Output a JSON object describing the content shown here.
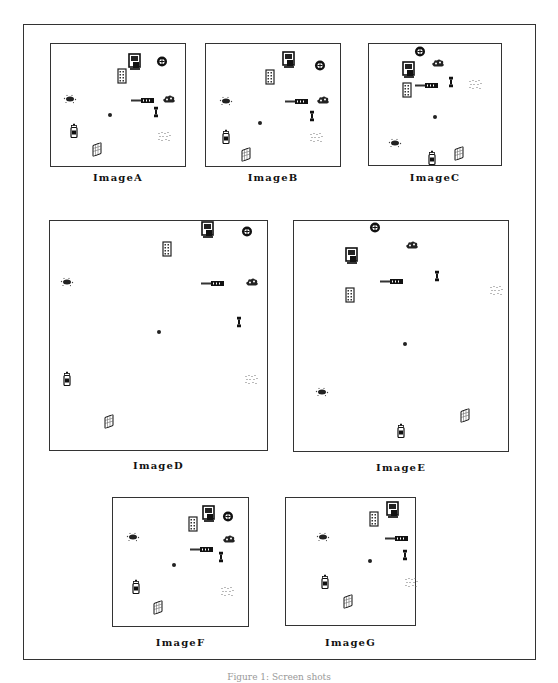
{
  "figure": {
    "caption": "Figure 1: Screen shots"
  },
  "panels": [
    {
      "id": "A",
      "label": "ImageA",
      "box": [
        50,
        43,
        136,
        124
      ],
      "label_y": 172,
      "objects": [
        {
          "type": "monitor",
          "x": 0.63,
          "y": 0.16
        },
        {
          "type": "wheel",
          "x": 0.83,
          "y": 0.15
        },
        {
          "type": "building",
          "x": 0.53,
          "y": 0.28
        },
        {
          "type": "pipe",
          "x": 0.69,
          "y": 0.44
        },
        {
          "type": "cloud",
          "x": 0.88,
          "y": 0.44
        },
        {
          "type": "splat",
          "x": 0.14,
          "y": 0.44
        },
        {
          "type": "dot",
          "x": 0.44,
          "y": 0.56
        },
        {
          "type": "key",
          "x": 0.78,
          "y": 0.56
        },
        {
          "type": "bottle",
          "x": 0.17,
          "y": 0.73
        },
        {
          "type": "dots",
          "x": 0.85,
          "y": 0.75
        },
        {
          "type": "panel",
          "x": 0.34,
          "y": 0.88
        }
      ]
    },
    {
      "id": "B",
      "label": "ImageB",
      "box": [
        205,
        43,
        136,
        124
      ],
      "label_y": 172,
      "objects": [
        {
          "type": "monitor",
          "x": 0.62,
          "y": 0.15
        },
        {
          "type": "wheel",
          "x": 0.85,
          "y": 0.18
        },
        {
          "type": "building",
          "x": 0.48,
          "y": 0.29
        },
        {
          "type": "pipe",
          "x": 0.68,
          "y": 0.45
        },
        {
          "type": "cloud",
          "x": 0.87,
          "y": 0.45
        },
        {
          "type": "splat",
          "x": 0.15,
          "y": 0.46
        },
        {
          "type": "key",
          "x": 0.79,
          "y": 0.59
        },
        {
          "type": "dot",
          "x": 0.4,
          "y": 0.62
        },
        {
          "type": "bottle",
          "x": 0.15,
          "y": 0.78
        },
        {
          "type": "dots",
          "x": 0.83,
          "y": 0.76
        },
        {
          "type": "panel",
          "x": 0.3,
          "y": 0.92
        }
      ]
    },
    {
      "id": "C",
      "label": "ImageC",
      "box": [
        368,
        43,
        134,
        123
      ],
      "label_y": 172,
      "objects": [
        {
          "type": "wheel",
          "x": 0.39,
          "y": 0.07
        },
        {
          "type": "cloud",
          "x": 0.52,
          "y": 0.15
        },
        {
          "type": "monitor",
          "x": 0.3,
          "y": 0.23
        },
        {
          "type": "pipe",
          "x": 0.44,
          "y": 0.32
        },
        {
          "type": "key",
          "x": 0.62,
          "y": 0.31
        },
        {
          "type": "dots",
          "x": 0.81,
          "y": 0.33
        },
        {
          "type": "building",
          "x": 0.29,
          "y": 0.4
        },
        {
          "type": "dot",
          "x": 0.5,
          "y": 0.58
        },
        {
          "type": "splat",
          "x": 0.2,
          "y": 0.81
        },
        {
          "type": "bottle",
          "x": 0.48,
          "y": 0.96
        },
        {
          "type": "panel",
          "x": 0.68,
          "y": 0.92
        }
      ]
    },
    {
      "id": "D",
      "label": "ImageD",
      "box": [
        49,
        220,
        219,
        231
      ],
      "label_y": 460,
      "objects": [
        {
          "type": "monitor",
          "x": 0.73,
          "y": 0.05
        },
        {
          "type": "wheel",
          "x": 0.91,
          "y": 0.05
        },
        {
          "type": "building",
          "x": 0.54,
          "y": 0.13
        },
        {
          "type": "splat",
          "x": 0.08,
          "y": 0.26
        },
        {
          "type": "pipe",
          "x": 0.75,
          "y": 0.26
        },
        {
          "type": "cloud",
          "x": 0.93,
          "y": 0.26
        },
        {
          "type": "key",
          "x": 0.87,
          "y": 0.44
        },
        {
          "type": "dot",
          "x": 0.5,
          "y": 0.47
        },
        {
          "type": "bottle",
          "x": 0.08,
          "y": 0.7
        },
        {
          "type": "dots",
          "x": 0.93,
          "y": 0.69
        },
        {
          "type": "panel",
          "x": 0.27,
          "y": 0.88
        }
      ]
    },
    {
      "id": "E",
      "label": "ImageE",
      "box": [
        293,
        220,
        216,
        232
      ],
      "label_y": 462,
      "objects": [
        {
          "type": "wheel",
          "x": 0.38,
          "y": 0.03
        },
        {
          "type": "cloud",
          "x": 0.55,
          "y": 0.1
        },
        {
          "type": "monitor",
          "x": 0.27,
          "y": 0.16
        },
        {
          "type": "pipe",
          "x": 0.46,
          "y": 0.25
        },
        {
          "type": "key",
          "x": 0.67,
          "y": 0.24
        },
        {
          "type": "dots",
          "x": 0.95,
          "y": 0.3
        },
        {
          "type": "building",
          "x": 0.26,
          "y": 0.33
        },
        {
          "type": "dot",
          "x": 0.52,
          "y": 0.52
        },
        {
          "type": "splat",
          "x": 0.13,
          "y": 0.74
        },
        {
          "type": "panel",
          "x": 0.8,
          "y": 0.85
        },
        {
          "type": "bottle",
          "x": 0.5,
          "y": 0.92
        }
      ]
    },
    {
      "id": "F",
      "label": "ImageF",
      "box": [
        112,
        497,
        137,
        130
      ],
      "label_y": 637,
      "objects": [
        {
          "type": "monitor",
          "x": 0.71,
          "y": 0.14
        },
        {
          "type": "wheel",
          "x": 0.85,
          "y": 0.15
        },
        {
          "type": "building",
          "x": 0.59,
          "y": 0.22
        },
        {
          "type": "splat",
          "x": 0.15,
          "y": 0.3
        },
        {
          "type": "cloud",
          "x": 0.86,
          "y": 0.31
        },
        {
          "type": "pipe",
          "x": 0.66,
          "y": 0.38
        },
        {
          "type": "key",
          "x": 0.8,
          "y": 0.46
        },
        {
          "type": "dot",
          "x": 0.45,
          "y": 0.5
        },
        {
          "type": "bottle",
          "x": 0.17,
          "y": 0.71
        },
        {
          "type": "dots",
          "x": 0.85,
          "y": 0.73
        },
        {
          "type": "panel",
          "x": 0.33,
          "y": 0.87
        }
      ]
    },
    {
      "id": "G",
      "label": "ImageG",
      "box": [
        285,
        497,
        131,
        129
      ],
      "label_y": 637,
      "objects": [
        {
          "type": "monitor",
          "x": 0.83,
          "y": 0.11
        },
        {
          "type": "building",
          "x": 0.68,
          "y": 0.18
        },
        {
          "type": "splat",
          "x": 0.29,
          "y": 0.3
        },
        {
          "type": "pipe",
          "x": 0.86,
          "y": 0.3
        },
        {
          "type": "key",
          "x": 0.92,
          "y": 0.45
        },
        {
          "type": "dot",
          "x": 0.65,
          "y": 0.47
        },
        {
          "type": "bottle",
          "x": 0.3,
          "y": 0.68
        },
        {
          "type": "dots",
          "x": 0.98,
          "y": 0.66
        },
        {
          "type": "panel",
          "x": 0.48,
          "y": 0.83
        }
      ]
    }
  ],
  "colors": {
    "border": "#333333",
    "ink": "#111111",
    "background": "#ffffff",
    "caption": "#999999"
  }
}
